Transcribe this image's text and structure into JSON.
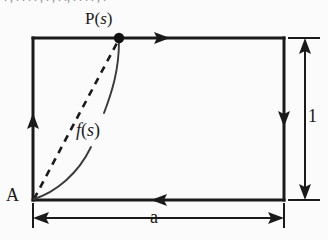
{
  "figure": {
    "type": "geometry-diagram",
    "background_color": "#fbfbfb",
    "line_color": "#1a1a1a",
    "labels": {
      "point_p": {
        "prefix": "P(",
        "variable": "s",
        "suffix": ")"
      },
      "corner_a": "A",
      "function_f": {
        "prefix": "f",
        "open": "(",
        "variable": "s",
        "close": ")"
      },
      "dimension_width": "a",
      "dimension_height": "1"
    },
    "rectangle": {
      "x": 33,
      "y": 38,
      "width": 251,
      "height": 162,
      "stroke_width": 3
    },
    "boundary_orientation": "clockwise",
    "boundary_arrows": [
      {
        "name": "top-edge-arrow",
        "direction": "right",
        "x": 160,
        "y": 38
      },
      {
        "name": "right-edge-arrow",
        "direction": "down",
        "x": 284,
        "y": 117
      },
      {
        "name": "bottom-edge-arrow",
        "direction": "left",
        "x": 161,
        "y": 200
      },
      {
        "name": "left-edge-arrow",
        "direction": "up",
        "x": 33,
        "y": 123
      }
    ],
    "point_p_marker": {
      "x": 119,
      "y": 38,
      "radius": 5
    },
    "chord": {
      "from": [
        33,
        200
      ],
      "to": [
        119,
        38
      ],
      "style": "dashed"
    },
    "leader_curves": [
      {
        "name": "upper-leader-curve",
        "from": [
          119,
          40
        ],
        "to": [
          104,
          112
        ]
      },
      {
        "name": "lower-leader-curve",
        "from": [
          34,
          199
        ],
        "to": [
          90,
          148
        ]
      }
    ],
    "dimensions": [
      {
        "name": "width-dimension",
        "label": "a",
        "axis": "horizontal",
        "y": 218,
        "x1": 33,
        "x2": 284
      },
      {
        "name": "height-dimension",
        "label": "1",
        "axis": "vertical",
        "x": 305,
        "y1": 38,
        "y2": 200
      }
    ],
    "top_cropped_text": ". , . . . . , . ,  . ., . . . . , ."
  }
}
